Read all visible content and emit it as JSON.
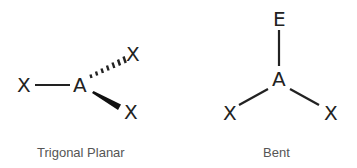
{
  "structures": [
    {
      "name": "trigonal-planar",
      "caption": "Trigonal Planar",
      "central_atom": "A",
      "ligands": [
        {
          "label": "X",
          "bond": "single",
          "position": "left"
        },
        {
          "label": "X",
          "bond": "hashed-wedge",
          "position": "upper-right"
        },
        {
          "label": "X",
          "bond": "solid-wedge",
          "position": "lower-right"
        }
      ]
    },
    {
      "name": "bent",
      "caption": "Bent",
      "central_atom": "A",
      "ligands": [
        {
          "label": "E",
          "bond": "single",
          "position": "top"
        },
        {
          "label": "X",
          "bond": "single",
          "position": "lower-left"
        },
        {
          "label": "X",
          "bond": "single",
          "position": "lower-right"
        }
      ]
    }
  ],
  "colors": {
    "atom_text": "#222222",
    "caption_text": "#555555",
    "bond": "#222222",
    "background": "#ffffff"
  }
}
